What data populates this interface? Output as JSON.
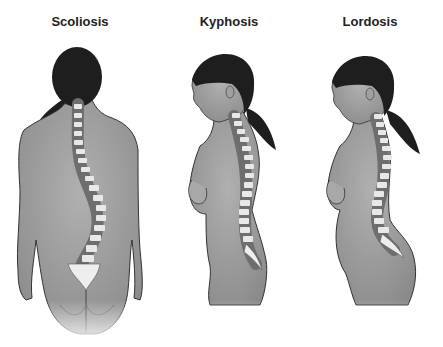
{
  "figures": [
    {
      "label": "Scoliosis",
      "view": "posterior",
      "spine_curve": "lateral S-curve"
    },
    {
      "label": "Kyphosis",
      "view": "lateral",
      "spine_curve": "excessive thoracic convexity"
    },
    {
      "label": "Lordosis",
      "view": "lateral",
      "spine_curve": "excessive lumbar concavity"
    }
  ],
  "colors": {
    "skin": "#9a9a9a",
    "skin_light": "#b4b4b4",
    "skin_shadow": "#7c7c7c",
    "hair": "#1e1e1e",
    "outline": "#333333",
    "vertebra": "#e8e8e8",
    "background": "#ffffff"
  }
}
